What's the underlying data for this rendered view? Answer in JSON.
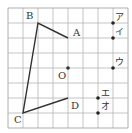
{
  "diagram": {
    "grid": {
      "cols": 8,
      "rows": 8,
      "origin_x": 8,
      "origin_y": 8,
      "cell": 15,
      "line_color": "#b5b5b5",
      "border_color": "#9a9a9a"
    },
    "figure_color": "#333333",
    "polyline": [
      "A",
      "B",
      "C",
      "D"
    ],
    "points": [
      {
        "id": "A",
        "label": "A",
        "gx": 4,
        "gy": 2,
        "lx": 5,
        "ly": -2
      },
      {
        "id": "B",
        "label": "B",
        "gx": 2,
        "gy": 1,
        "lx": -12,
        "ly": -4
      },
      {
        "id": "C",
        "label": "C",
        "gx": 1,
        "gy": 7,
        "lx": -9,
        "ly": 10
      },
      {
        "id": "D",
        "label": "D",
        "gx": 4,
        "gy": 6,
        "lx": 3,
        "ly": 11
      },
      {
        "id": "O",
        "label": "O",
        "gx": 4,
        "gy": 4,
        "lx": -10,
        "ly": 11,
        "dot": true
      }
    ],
    "candidates": [
      {
        "id": "a",
        "label": "ア",
        "gx": 7,
        "gy": 1,
        "lx": 2,
        "ly": -3
      },
      {
        "id": "i",
        "label": "イ",
        "gx": 7,
        "gy": 2,
        "lx": 2,
        "ly": -3
      },
      {
        "id": "u",
        "label": "ウ",
        "gx": 7,
        "gy": 4,
        "lx": 2,
        "ly": -3
      },
      {
        "id": "e",
        "label": "エ",
        "gx": 6,
        "gy": 6,
        "lx": 3,
        "ly": -2
      },
      {
        "id": "o",
        "label": "オ",
        "gx": 6,
        "gy": 7,
        "lx": 3,
        "ly": -4
      }
    ]
  }
}
